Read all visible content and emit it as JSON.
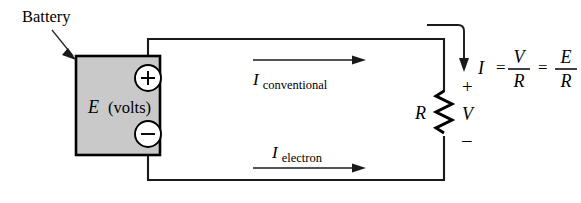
{
  "figure": {
    "type": "circuit-diagram",
    "background_color": "#ffffff",
    "line_color": "#1a1a1a",
    "battery_fill_color": "#c9c9c9"
  },
  "labels": {
    "battery": "Battery",
    "source_symbol": "E",
    "source_unit": "(volts)",
    "plus_terminal": "+",
    "minus_terminal": "–",
    "resistor": "R",
    "voltage_drop": "V",
    "voltage_plus": "+",
    "voltage_minus": "–"
  },
  "currents": {
    "conventional": {
      "symbol": "I",
      "subscript": "conventional",
      "direction": "right"
    },
    "electron": {
      "symbol": "I",
      "subscript": "electron",
      "direction": "right"
    },
    "into_resistor": {
      "symbol": "I",
      "direction": "down"
    }
  },
  "equation": {
    "lhs": "I",
    "eq1": "=",
    "frac1_num": "V",
    "frac1_den": "R",
    "eq2": "=",
    "frac2_num": "E",
    "frac2_den": "R"
  }
}
